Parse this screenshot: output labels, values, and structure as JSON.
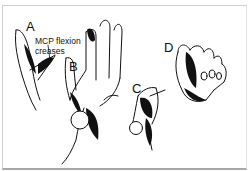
{
  "figure": {
    "panels": [
      {
        "id": "A",
        "label": "A",
        "description": "hand with MCP flexion creases, lateral view"
      },
      {
        "id": "B",
        "label": "B",
        "description": "open hand with extended fingers, nodular palm lesion"
      },
      {
        "id": "C",
        "label": "C",
        "description": "palm with nodule at base"
      },
      {
        "id": "D",
        "label": "D",
        "description": "fist / flexed fingers, dorsal view"
      }
    ],
    "annotation": {
      "line1": "MCP flexion",
      "line2": "creases"
    }
  }
}
